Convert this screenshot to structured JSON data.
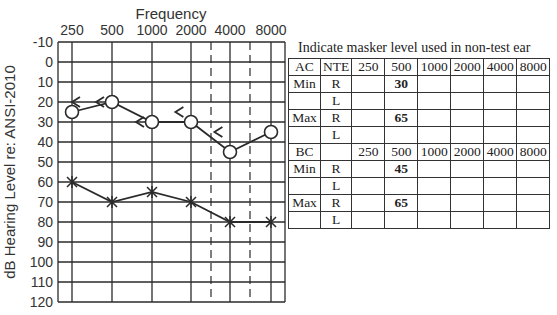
{
  "chart_data": {
    "type": "line",
    "title": "Frequency",
    "xlabel": "Frequency",
    "ylabel": "dB Hearing Level re: ANSI-2010",
    "categories": [
      "250",
      "500",
      "1000",
      "2000",
      "4000",
      "8000"
    ],
    "y_ticks": [
      "-10",
      "0",
      "10",
      "20",
      "30",
      "40",
      "50",
      "60",
      "70",
      "80",
      "90",
      "100",
      "110",
      "120"
    ],
    "ylim": [
      -10,
      120
    ],
    "y_inverted": true,
    "grid": true,
    "dashed_verticals_at": [
      "3000",
      "6000"
    ],
    "series": [
      {
        "name": "Right AC (O, masked)",
        "marker": "circle",
        "values": [
          25,
          20,
          30,
          30,
          45,
          35
        ]
      },
      {
        "name": "Left AC (X)",
        "marker": "x",
        "values": [
          60,
          70,
          65,
          70,
          80,
          80
        ]
      }
    ],
    "annotations": [
      {
        "symbol": "<",
        "freq_pos": 0.0,
        "db": 20,
        "note": "unmasked right BC at 250 (at left axis)"
      },
      {
        "symbol": "<",
        "freq_pos": 0.6,
        "db": 20,
        "note": "right BC near 500"
      },
      {
        "symbol": "<",
        "freq_pos": 1.6,
        "db": 30,
        "note": "right BC near 1000"
      },
      {
        "symbol": "<",
        "freq_pos": 2.6,
        "db": 25,
        "note": "right BC near 2000"
      },
      {
        "symbol": "<",
        "freq_pos": 3.6,
        "db": 35,
        "note": "right BC near 4000"
      }
    ]
  },
  "table": {
    "title": "Indicate masker level used in non-test ear",
    "ac_header": [
      "AC",
      "NTE",
      "250",
      "500",
      "1000",
      "2000",
      "4000",
      "8000"
    ],
    "ac_rows": [
      [
        "Min",
        "R",
        "",
        "30",
        "",
        "",
        "",
        ""
      ],
      [
        "",
        "L",
        "",
        "",
        "",
        "",
        "",
        ""
      ],
      [
        "Max",
        "R",
        "",
        "65",
        "",
        "",
        "",
        ""
      ],
      [
        "",
        "L",
        "",
        "",
        "",
        "",
        "",
        ""
      ]
    ],
    "bc_header": [
      "BC",
      "",
      "250",
      "500",
      "1000",
      "2000",
      "4000",
      "8000"
    ],
    "bc_rows": [
      [
        "Min",
        "R",
        "",
        "45",
        "",
        "",
        "",
        ""
      ],
      [
        "",
        "L",
        "",
        "",
        "",
        "",
        "",
        ""
      ],
      [
        "Max",
        "R",
        "",
        "65",
        "",
        "",
        "",
        ""
      ],
      [
        "",
        "L",
        "",
        "",
        "",
        "",
        "",
        ""
      ]
    ]
  }
}
